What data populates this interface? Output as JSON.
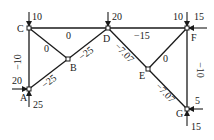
{
  "diagram": {
    "type": "truss-member-forces",
    "nodes": [
      {
        "id": "A",
        "label": "A"
      },
      {
        "id": "B",
        "label": "B"
      },
      {
        "id": "C",
        "label": "C"
      },
      {
        "id": "D",
        "label": "D"
      },
      {
        "id": "E",
        "label": "E"
      },
      {
        "id": "F",
        "label": "F"
      },
      {
        "id": "G",
        "label": "G"
      }
    ],
    "members": [
      {
        "from": "C",
        "to": "D",
        "force": "0"
      },
      {
        "from": "C",
        "to": "B",
        "force": "0"
      },
      {
        "from": "C",
        "to": "A",
        "force": "−10"
      },
      {
        "from": "A",
        "to": "B",
        "force": "−25"
      },
      {
        "from": "B",
        "to": "D",
        "force": "−25"
      },
      {
        "from": "D",
        "to": "F",
        "force": "−15"
      },
      {
        "from": "D",
        "to": "E",
        "force": "−7.07"
      },
      {
        "from": "E",
        "to": "G",
        "force": "−7.07"
      },
      {
        "from": "E",
        "to": "F",
        "force": "0"
      },
      {
        "from": "F",
        "to": "G",
        "force": "−10"
      }
    ],
    "loads": [
      {
        "node": "C",
        "direction": "down",
        "value": "10"
      },
      {
        "node": "D",
        "direction": "down",
        "value": "20"
      },
      {
        "node": "F",
        "direction": "down",
        "value": "10"
      },
      {
        "node": "F",
        "direction": "left",
        "value": "15"
      },
      {
        "node": "A",
        "direction": "right",
        "value": "20"
      },
      {
        "node": "A",
        "direction": "up",
        "value": "25"
      },
      {
        "node": "G",
        "direction": "left",
        "value": "5"
      },
      {
        "node": "G",
        "direction": "up",
        "value": "15"
      }
    ]
  }
}
